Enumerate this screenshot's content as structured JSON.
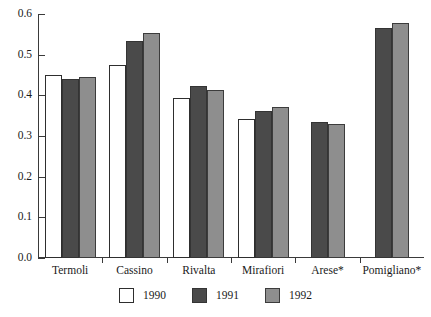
{
  "chart_data": {
    "type": "bar",
    "title": "",
    "subtitle": "",
    "xlabel": "",
    "ylabel": "",
    "categories": [
      "Termoli",
      "Cassino",
      "Rivalta",
      "Mirafiori",
      "Arese*",
      "Pomigliano*"
    ],
    "series": [
      {
        "name": "1990",
        "color": "#ffffff",
        "values": [
          0.45,
          0.475,
          0.393,
          0.342,
          null,
          null
        ]
      },
      {
        "name": "1991",
        "color": "#4a4a4a",
        "values": [
          0.44,
          0.533,
          0.423,
          0.362,
          0.335,
          0.565
        ]
      },
      {
        "name": "1992",
        "color": "#8e8e8e",
        "values": [
          0.446,
          0.553,
          0.413,
          0.372,
          0.33,
          0.577
        ]
      }
    ],
    "ylim": [
      0.0,
      0.6
    ],
    "ytick_values": [
      0.0,
      0.1,
      0.2,
      0.3,
      0.4,
      0.5,
      0.6
    ],
    "ytick_labels": [
      "0.0",
      "0.1",
      "0.2",
      "0.3",
      "0.4",
      "0.5",
      "0.6"
    ],
    "grid": false,
    "legend_position": "bottom",
    "legend_entries": [
      "1990",
      "1991",
      "1992"
    ],
    "annotations": []
  },
  "colors": {
    "background": "#ffffff",
    "axis": "#3a3a3a",
    "text": "#1a1a1a",
    "bar_1990": "#ffffff",
    "bar_1991": "#4a4a4a",
    "bar_1992": "#8e8e8e"
  }
}
